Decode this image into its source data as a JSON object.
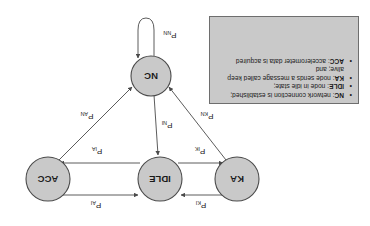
{
  "figure": {
    "kind": "state-transition-diagram",
    "orientation": "rotated-180"
  },
  "nodes": [
    {
      "id": "KA",
      "label": "KA",
      "cx": 133,
      "cy": 47,
      "r": 22
    },
    {
      "id": "IDLE",
      "label": "IDLE",
      "cx": 210,
      "cy": 47,
      "r": 22
    },
    {
      "id": "ACC",
      "label": "ACC",
      "cx": 322,
      "cy": 47,
      "r": 22
    },
    {
      "id": "NC",
      "label": "NC",
      "cx": 219,
      "cy": 150,
      "r": 20
    }
  ],
  "edges": [
    {
      "id": "ka-to-idle",
      "from": "KA",
      "to": "IDLE",
      "base": "P",
      "sub": "KI"
    },
    {
      "id": "idle-to-ka",
      "from": "IDLE",
      "to": "KA",
      "base": "P",
      "sub": "IK"
    },
    {
      "id": "acc-to-idle",
      "from": "ACC",
      "to": "IDLE",
      "base": "P",
      "sub": "AI"
    },
    {
      "id": "idle-to-acc",
      "from": "IDLE",
      "to": "ACC",
      "base": "P",
      "sub": "IA"
    },
    {
      "id": "nc-to-idle",
      "from": "NC",
      "to": "IDLE",
      "base": "P",
      "sub": "NI"
    },
    {
      "id": "ka-to-nc",
      "from": "KA",
      "to": "NC",
      "base": "P",
      "sub": "KN"
    },
    {
      "id": "acc-to-nc",
      "from": "ACC",
      "to": "NC",
      "base": "P",
      "sub": "AN"
    },
    {
      "id": "nc-self-loop",
      "from": "NC",
      "to": "NC",
      "base": "P",
      "sub": "NN"
    }
  ],
  "legend": {
    "bullet": "•",
    "items": [
      {
        "term": "NC",
        "text": ": network connection is established;"
      },
      {
        "term": "IDLE",
        "text": ": node in idle state;"
      },
      {
        "term": "KA",
        "text": ": node sends a message called keep alive; and"
      },
      {
        "term": "ACC",
        "text": ": accelerometer data is acquired"
      }
    ]
  },
  "colors": {
    "node_fill": "#c9c9c9",
    "node_stroke": "#4a4a4a",
    "legend_fill": "#c9c9c9",
    "legend_stroke": "#6e6e6e",
    "text": "#1a1a1a",
    "background": "#ffffff"
  }
}
